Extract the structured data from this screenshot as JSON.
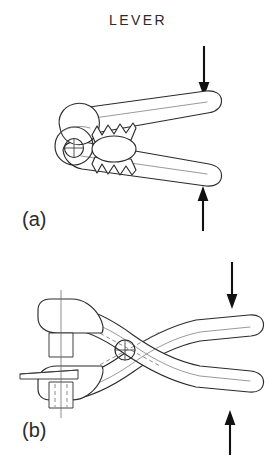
{
  "figure": {
    "title": "LEVER",
    "background_color": "#ffffff",
    "line_color": "#2b2b2b",
    "arrow_color": "#111111",
    "hidden_line_color": "#707070",
    "panels": [
      {
        "id": "panel-a",
        "label": "(a)",
        "description": "Side elevation of a pincer-type lever with serrated jaws gripping an oval workpiece about a single pivot",
        "pivot_symbol": "crossed-circle",
        "workpiece": "oval",
        "jaw_type": "serrated",
        "forces": [
          {
            "name": "upper-handle-force",
            "direction": "down",
            "applied_to": "upper handle"
          },
          {
            "name": "lower-handle-force",
            "direction": "up",
            "applied_to": "lower handle"
          }
        ]
      },
      {
        "id": "panel-b",
        "label": "(b)",
        "description": "Plan view of crossed-handle pliers gripping a flat plate, pivot at the handle crossing",
        "pivot_symbol": "crossed-circle",
        "workpiece": "flat plate",
        "jaw_type": "flat",
        "forces": [
          {
            "name": "upper-handle-force",
            "direction": "down",
            "applied_to": "upper handle"
          },
          {
            "name": "lower-handle-force",
            "direction": "up",
            "applied_to": "lower handle"
          }
        ]
      }
    ]
  }
}
